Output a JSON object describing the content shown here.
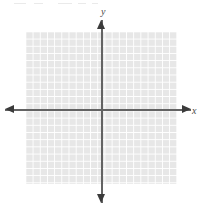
{
  "figure": {
    "type": "blank-coordinate-plane",
    "width": 207,
    "height": 215,
    "background_color": "#ffffff"
  },
  "grid": {
    "left": 26,
    "top": 32,
    "width": 151,
    "height": 152,
    "cell_size": 7.2,
    "columns": 21,
    "rows": 21,
    "cell_color": "#e7e7e7",
    "line_color": "#ffffff"
  },
  "axes": {
    "color": "#636363",
    "arrow_color": "#3b3b3b",
    "origin_x": 102,
    "origin_y": 110,
    "x_axis": {
      "label": "x",
      "left": 5,
      "right": 191,
      "arrow_left": "arrow-left-icon",
      "arrow_right": "arrow-right-icon"
    },
    "y_axis": {
      "label": "y",
      "top": 20,
      "bottom": 203,
      "arrow_up": "arrow-up-icon",
      "arrow_down": "arrow-down-icon"
    }
  },
  "artifacts": [
    {
      "left": 14,
      "top": 3,
      "width": 12
    },
    {
      "left": 34,
      "top": 3,
      "width": 9
    },
    {
      "left": 58,
      "top": 3,
      "width": 14
    },
    {
      "left": 78,
      "top": 3,
      "width": 8
    },
    {
      "left": 92,
      "top": 3,
      "width": 6
    }
  ],
  "chart_data": {
    "type": "scatter",
    "title": "",
    "subtitle": "",
    "xlabel": "x",
    "ylabel": "y",
    "xlim": [
      -10.5,
      10.5
    ],
    "ylim": [
      -10.5,
      10.5
    ],
    "xticks": [],
    "yticks": [],
    "grid": true,
    "grid_spacing": 1,
    "legend": null,
    "series": [
      {
        "name": "",
        "x": [],
        "y": []
      }
    ],
    "annotations": [],
    "note": "Empty Cartesian grid with no plotted data points or curves."
  }
}
